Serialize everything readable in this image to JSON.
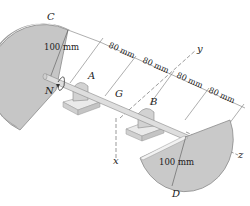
{
  "diagram": {
    "type": "mechanics-shaft-with-semicircular-disks",
    "points": {
      "C": "C",
      "A": "A",
      "N": "N",
      "G": "G",
      "B": "B",
      "D": "D"
    },
    "axes": {
      "x": "x",
      "y": "y",
      "z": "z"
    },
    "dimensions": {
      "disk_C_radius": "100 mm",
      "disk_D_radius": "100 mm",
      "spacing": [
        "80 mm",
        "80 mm",
        "80 mm",
        "80 mm"
      ]
    },
    "colors": {
      "disk": "#c9c9c9",
      "disk_edge": "#9a9a9a",
      "shaft": "#dcdcdc",
      "bearing": "#d4d4d4",
      "base": "#e6e6e6",
      "line": "#555555"
    }
  }
}
